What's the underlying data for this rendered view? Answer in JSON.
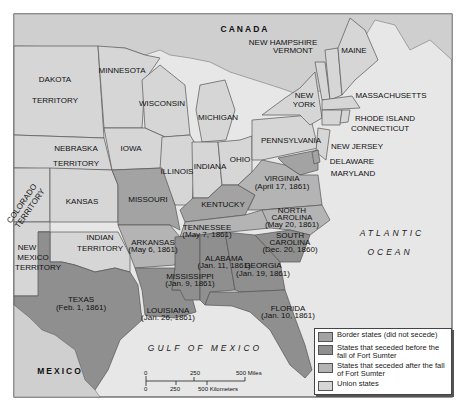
{
  "map": {
    "title": "The United States in 1861 - Secession",
    "regions": {
      "canada": "CANADA",
      "mexico": "MEXICO",
      "atlantic_line1": "ATLANTIC",
      "atlantic_line2": "OCEAN",
      "gulf": "GULF OF MEXICO"
    },
    "states": {
      "dakota_1": "DAKOTA",
      "dakota_2": "TERRITORY",
      "minnesota": "MINNESOTA",
      "wisconsin": "WISCONSIN",
      "michigan": "MICHIGAN",
      "nebraska_1": "NEBRASKA",
      "nebraska_2": "TERRITORY",
      "iowa": "IOWA",
      "illinois": "ILLINOIS",
      "indiana": "INDIANA",
      "ohio": "OHIO",
      "pennsylvania": "PENNSYLVANIA",
      "new_york_1": "NEW",
      "new_york_2": "YORK",
      "new_hampshire": "NEW HAMPSHIRE",
      "vermont": "VERMONT",
      "maine": "MAINE",
      "massachusetts": "MASSACHUSETTS",
      "rhode_island": "RHODE ISLAND",
      "connecticut": "CONNECTICUT",
      "new_jersey": "NEW JERSEY",
      "delaware": "DELAWARE",
      "maryland": "MARYLAND",
      "colorado_1": "COLORADO",
      "colorado_2": "TERRITORY",
      "kansas": "KANSAS",
      "missouri": "MISSOURI",
      "kentucky": "KENTUCKY",
      "virginia": "VIRGINIA",
      "virginia_date": "(April 17, 1861)",
      "north_carolina_1": "NORTH",
      "north_carolina_2": "CAROLINA",
      "north_carolina_date": "(May 20, 1861)",
      "tennessee": "TENNESSEE",
      "tennessee_date": "(May 7, 1861)",
      "south_carolina_1": "SOUTH",
      "south_carolina_2": "CAROLINA",
      "south_carolina_date": "(Dec. 20, 1860)",
      "new_mexico_1": "NEW",
      "new_mexico_2": "MEXICO",
      "new_mexico_3": "TERRITORY",
      "indian_1": "INDIAN",
      "indian_2": "TERRITORY",
      "arkansas": "ARKANSAS",
      "arkansas_date": "(May 6, 1861)",
      "alabama": "ALABAMA",
      "alabama_date": "(Jan. 11, 1861)",
      "georgia": "GEORGIA",
      "georgia_date": "(Jan. 19, 1861)",
      "mississippi": "MISSISSIPPI",
      "mississippi_date": "(Jan. 9, 1861)",
      "texas": "TEXAS",
      "texas_date": "(Feb. 1, 1861)",
      "louisiana": "LOUISIANA",
      "louisiana_date": "(Jan. 26, 1861)",
      "florida": "FLORIDA",
      "florida_date": "(Jan. 10, 1861)"
    },
    "scale": {
      "miles_0": "0",
      "miles_250": "250",
      "miles_500": "500 Miles",
      "km_0": "0",
      "km_250": "250",
      "km_500": "500 Kilometers"
    }
  },
  "legend": {
    "items": [
      {
        "label": "Border states (did not secede)",
        "color": "#a3a3a3"
      },
      {
        "label": "States that seceded before the fall of Fort Sumter",
        "color": "#8f8f8f"
      },
      {
        "label": "States that seceded after the fall of Fort Sumter",
        "color": "#b4b4b4"
      },
      {
        "label": "Union states",
        "color": "#d6d6d6"
      }
    ]
  }
}
